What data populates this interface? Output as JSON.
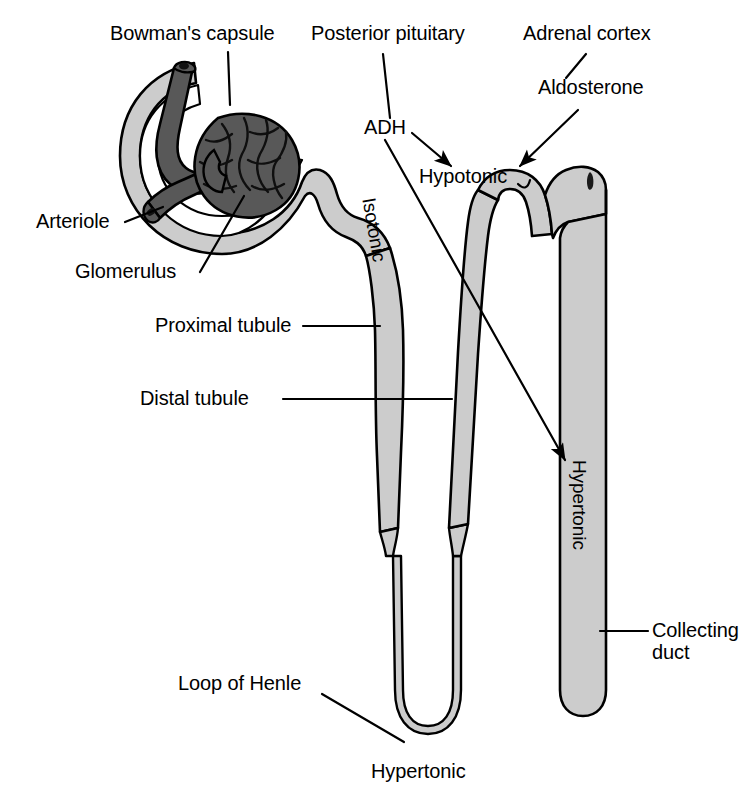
{
  "diagram": {
    "background_color": "#ffffff",
    "line_color": "#000000",
    "tubule_fill": "#cccccc",
    "vessel_fill": "#585858",
    "capsule_fill": "#cccccc"
  },
  "labels": {
    "bowmans_capsule": "Bowman's capsule",
    "posterior_pituitary": "Posterior pituitary",
    "adrenal_cortex": "Adrenal cortex",
    "aldosterone": "Aldosterone",
    "adh": "ADH",
    "arteriole": "Arteriole",
    "glomerulus": "Glomerulus",
    "proximal_tubule": "Proximal tubule",
    "distal_tubule": "Distal tubule",
    "loop_of_henle": "Loop of Henle",
    "collecting_duct_line1": "Collecting",
    "collecting_duct_line2": "duct",
    "hypotonic": "Hypotonic",
    "hypertonic_loop": "Hypertonic",
    "isotonic_vertical": "Isotonic",
    "hypertonic_vertical": "Hypertonic"
  },
  "structures": [
    {
      "name": "bowmans-capsule",
      "tonicity": null
    },
    {
      "name": "glomerulus",
      "tonicity": null
    },
    {
      "name": "afferent-arteriole",
      "tonicity": null
    },
    {
      "name": "efferent-arteriole",
      "tonicity": null
    },
    {
      "name": "proximal-tubule",
      "tonicity": "Isotonic"
    },
    {
      "name": "loop-of-henle",
      "tonicity": "Hypertonic"
    },
    {
      "name": "distal-tubule",
      "tonicity": "Hypotonic"
    },
    {
      "name": "collecting-duct",
      "tonicity": "Hypertonic"
    }
  ],
  "hormones": [
    {
      "name": "ADH",
      "source": "Posterior pituitary",
      "targets": [
        "distal-tubule",
        "collecting-duct"
      ]
    },
    {
      "name": "Aldosterone",
      "source": "Adrenal cortex",
      "targets": [
        "distal-tubule"
      ]
    }
  ]
}
